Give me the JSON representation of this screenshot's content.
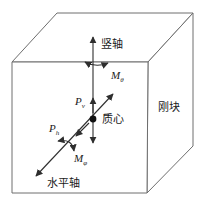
{
  "figure": {
    "background_color": "#ffffff",
    "cube_edge_color": "#6e6e6e",
    "arrow_color": "#2e2e2e",
    "text_color": "#1a1a1a",
    "labels": {
      "vertical_axis": "竖轴",
      "horizontal_axis": "水平轴",
      "center_of_mass": "质心",
      "rigid_block": "刚块",
      "moment_about_vertical_axis": {
        "base": "M",
        "sub": "θ"
      },
      "moment_about_horizontal_axis": {
        "base": "M",
        "sub": "φ"
      },
      "vertical_force": {
        "base": "P",
        "sub": "v"
      },
      "horizontal_force": {
        "base": "P",
        "sub": "h"
      }
    }
  }
}
